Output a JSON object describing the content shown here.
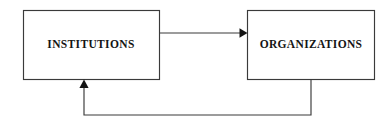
{
  "diagram": {
    "type": "flow-diagram",
    "background_color": "#ffffff",
    "stroke_color": "#3a3a3a",
    "text_color": "#141414",
    "nodes": [
      {
        "id": "institutions",
        "label": "INSTITUTIONS",
        "shape": "rectangle",
        "x": 23,
        "y": 10,
        "width": 136,
        "height": 70,
        "center_x": 91,
        "center_y": 45
      },
      {
        "id": "organizations",
        "label": "ORGANIZATIONS",
        "shape": "rectangle",
        "x": 247,
        "y": 10,
        "width": 128,
        "height": 70,
        "center_x": 311,
        "center_y": 45
      }
    ],
    "edges": [
      {
        "id": "institutions-to-organizations",
        "from": "institutions",
        "to": "organizations",
        "label": "",
        "style": "solid",
        "arrowhead": "filled-triangle",
        "direction": "right",
        "path": "M 159 33 L 240 33",
        "arrow_points": "240,28.5 247.5,33 240,37.5"
      },
      {
        "id": "organizations-to-institutions",
        "from": "organizations",
        "to": "institutions",
        "label": "",
        "style": "solid",
        "arrowhead": "filled-triangle",
        "direction": "up",
        "path": "M 311 80 L 311 115 L 84 115 L 84 88",
        "arrow_points": "79.5,88 84,80 88.5,88"
      }
    ]
  }
}
